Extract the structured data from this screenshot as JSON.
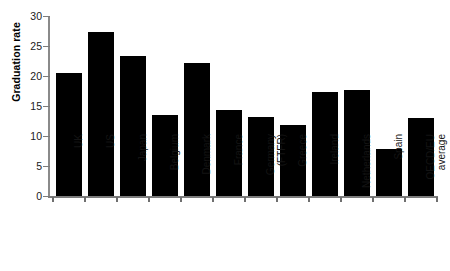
{
  "chart_data": {
    "type": "bar",
    "title": "",
    "xlabel": "",
    "ylabel": "Graduation rate",
    "ylim": [
      0,
      30
    ],
    "yticks": [
      "0",
      "5",
      "10",
      "15",
      "20",
      "25",
      "30"
    ],
    "grid": false,
    "legend": null,
    "bar_color": "#000000",
    "categories": [
      "UK",
      "US",
      "Japan",
      "Belgium",
      "Denmark",
      "France",
      "Germany\n(FTFR)",
      "Greece",
      "Ireland",
      "Netherlands",
      "Spain",
      "OECD/EU\naverage"
    ],
    "values": [
      20.5,
      27.3,
      23.3,
      13.5,
      22.2,
      14.3,
      13.2,
      11.8,
      17.3,
      17.6,
      7.8,
      13.0
    ]
  }
}
